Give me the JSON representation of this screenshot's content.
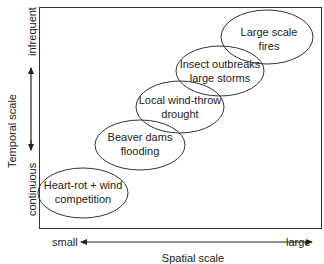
{
  "diagram": {
    "y_axis": {
      "label": "Temporal scale",
      "top_label": "infrequent",
      "bottom_label": "continuous"
    },
    "x_axis": {
      "label": "Spatial scale",
      "left_label": "small",
      "right_label": "large"
    },
    "disturbances": [
      {
        "line1": "Heart-rot + wind",
        "line2": "competition"
      },
      {
        "line1": "Beaver dams",
        "line2": "flooding"
      },
      {
        "line1": "Local wind-throw",
        "line2": "drought"
      },
      {
        "line1": "Insect outbreaks",
        "line2": "large storms"
      },
      {
        "line1": "Large scale",
        "line2": "fires"
      }
    ],
    "colors": {
      "stroke": "#333333",
      "text": "#222222",
      "background": "#ffffff"
    }
  }
}
